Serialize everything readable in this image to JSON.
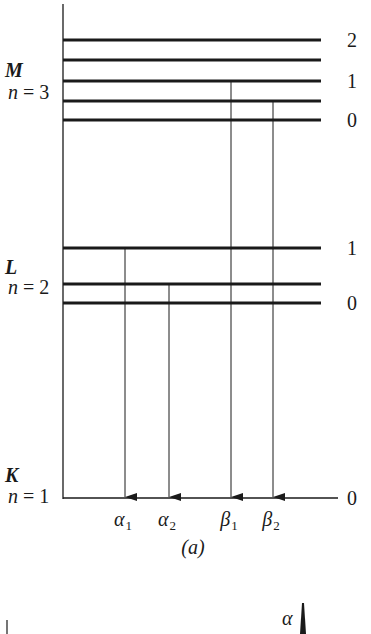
{
  "figure": {
    "caption": "(a)",
    "ink_color": "#1a1a1a",
    "background": "#ffffff"
  },
  "axis": {
    "x": 63,
    "top": 4,
    "bottom": 498
  },
  "shells": [
    {
      "id": "M",
      "letter": "M",
      "n_label": "n = 3",
      "letter_y": 77,
      "n_y": 99
    },
    {
      "id": "L",
      "letter": "L",
      "n_label": "n = 2",
      "letter_y": 274,
      "n_y": 294
    },
    {
      "id": "K",
      "letter": "K",
      "n_label": "n = 1",
      "letter_y": 482,
      "n_y": 503
    }
  ],
  "levels": [
    {
      "shell": "M",
      "y": 40,
      "x2": 321,
      "label": "2"
    },
    {
      "shell": "M",
      "y": 60,
      "x2": 321,
      "label": ""
    },
    {
      "shell": "M",
      "y": 81,
      "x2": 321,
      "label": "1"
    },
    {
      "shell": "M",
      "y": 101,
      "x2": 321,
      "label": ""
    },
    {
      "shell": "M",
      "y": 120,
      "x2": 321,
      "label": "0"
    },
    {
      "shell": "L",
      "y": 248,
      "x2": 321,
      "label": "1"
    },
    {
      "shell": "L",
      "y": 284,
      "x2": 321,
      "label": ""
    },
    {
      "shell": "L",
      "y": 303,
      "x2": 321,
      "label": "0"
    },
    {
      "shell": "K",
      "y": 498,
      "x2": 338,
      "label": "0"
    }
  ],
  "transitions": [
    {
      "name": "α",
      "sub": "1",
      "x": 125,
      "from_y": 248,
      "to_y": 498
    },
    {
      "name": "α",
      "sub": "2",
      "x": 169,
      "from_y": 284,
      "to_y": 498
    },
    {
      "name": "β",
      "sub": "1",
      "x": 231,
      "from_y": 81,
      "to_y": 498
    },
    {
      "name": "β",
      "sub": "2",
      "x": 273,
      "from_y": 101,
      "to_y": 498
    }
  ],
  "lower_panel": {
    "peak_label": "α",
    "tick_x": 7,
    "peak_x": 303
  }
}
